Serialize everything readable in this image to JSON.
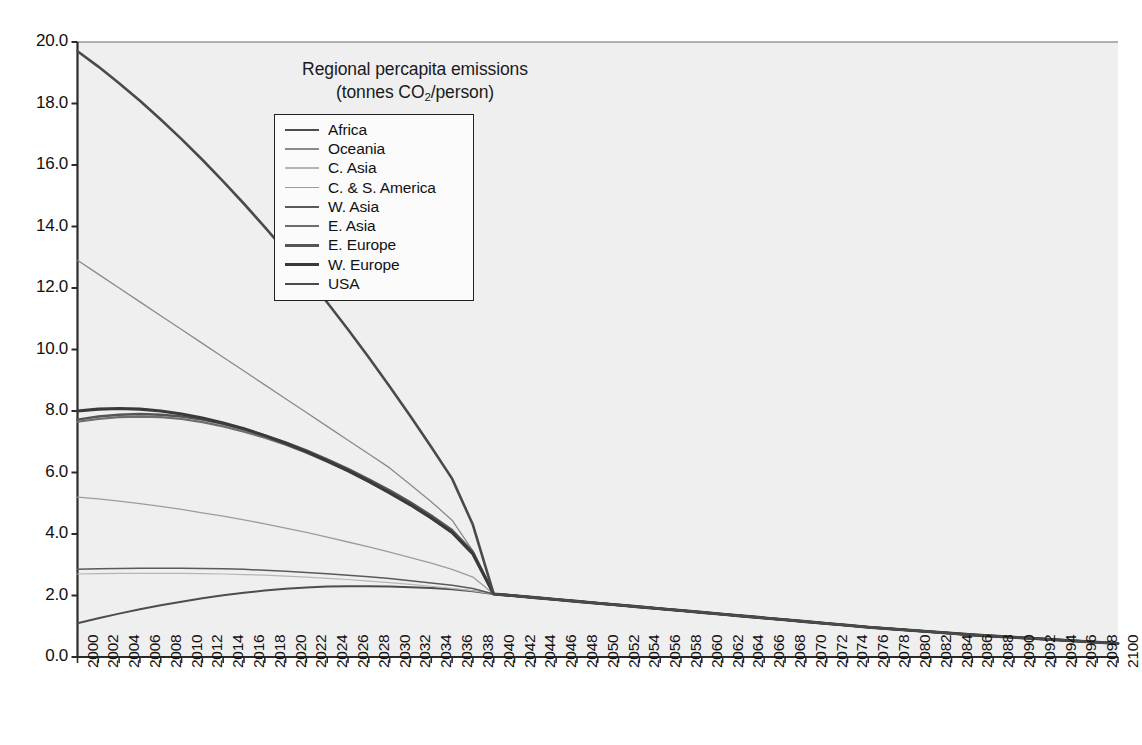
{
  "chart_data": {
    "type": "line",
    "title": "Regional percapita emissions",
    "subtitle": "(tonnes CO2/person)",
    "title_line1": "Regional percapita emissions",
    "title_line2_pre": "(tonnes CO",
    "title_line2_sub": "2",
    "title_line2_post": "/person)",
    "xlabel": "",
    "ylabel": "",
    "xlim": [
      2000,
      2100
    ],
    "ylim": [
      0.0,
      20.0
    ],
    "y_tick_step": 2.0,
    "x_tick_step": 2,
    "grid": false,
    "legend_position": "upper-center",
    "x": [
      2000,
      2002,
      2004,
      2006,
      2008,
      2010,
      2012,
      2014,
      2016,
      2018,
      2020,
      2022,
      2024,
      2026,
      2028,
      2030,
      2032,
      2034,
      2036,
      2038,
      2040,
      2042,
      2044,
      2046,
      2048,
      2050,
      2052,
      2054,
      2056,
      2058,
      2060,
      2062,
      2064,
      2066,
      2068,
      2070,
      2072,
      2074,
      2076,
      2078,
      2080,
      2082,
      2084,
      2086,
      2088,
      2090,
      2092,
      2094,
      2096,
      2098,
      2100
    ],
    "y_tick_labels": [
      "0.0",
      "2.0",
      "4.0",
      "6.0",
      "8.0",
      "10.0",
      "12.0",
      "14.0",
      "16.0",
      "18.0",
      "20.0"
    ],
    "x_tick_labels": [
      "2000",
      "2002",
      "2004",
      "2006",
      "2008",
      "2010",
      "2012",
      "2014",
      "2016",
      "2018",
      "2020",
      "2022",
      "2024",
      "2026",
      "2028",
      "2030",
      "2032",
      "2034",
      "2036",
      "2038",
      "2040",
      "2042",
      "2044",
      "2046",
      "2048",
      "2050",
      "2052",
      "2054",
      "2056",
      "2058",
      "2060",
      "2062",
      "2064",
      "2066",
      "2068",
      "2070",
      "2072",
      "2074",
      "2076",
      "2078",
      "2080",
      "2082",
      "2084",
      "2086",
      "2088",
      "2090",
      "2092",
      "2094",
      "2096",
      "2098",
      "2100"
    ],
    "series": [
      {
        "name": "Africa",
        "color": "#4d4d4d",
        "width": 2.0,
        "values": [
          1.1,
          1.26,
          1.41,
          1.55,
          1.68,
          1.8,
          1.91,
          2.01,
          2.09,
          2.16,
          2.22,
          2.26,
          2.29,
          2.3,
          2.3,
          2.29,
          2.27,
          2.24,
          2.2,
          2.14,
          2.05,
          1.99,
          1.93,
          1.87,
          1.81,
          1.75,
          1.69,
          1.63,
          1.57,
          1.51,
          1.45,
          1.39,
          1.33,
          1.27,
          1.21,
          1.15,
          1.09,
          1.03,
          0.97,
          0.92,
          0.87,
          0.82,
          0.77,
          0.72,
          0.68,
          0.64,
          0.6,
          0.56,
          0.52,
          0.48,
          0.44
        ]
      },
      {
        "name": "Oceania",
        "color": "#8a8a8a",
        "width": 1.3,
        "values": [
          12.9,
          12.45,
          12.0,
          11.55,
          11.1,
          10.65,
          10.2,
          9.75,
          9.3,
          8.85,
          8.4,
          7.95,
          7.5,
          7.05,
          6.6,
          6.15,
          5.6,
          5.05,
          4.45,
          3.45,
          2.05,
          1.99,
          1.93,
          1.87,
          1.81,
          1.75,
          1.69,
          1.63,
          1.57,
          1.51,
          1.45,
          1.39,
          1.33,
          1.27,
          1.21,
          1.15,
          1.09,
          1.03,
          0.97,
          0.92,
          0.87,
          0.82,
          0.77,
          0.72,
          0.68,
          0.64,
          0.6,
          0.56,
          0.52,
          0.48,
          0.44
        ]
      },
      {
        "name": "C. Asia",
        "color": "#b5b5b5",
        "width": 1.2,
        "values": [
          2.7,
          2.71,
          2.72,
          2.72,
          2.72,
          2.72,
          2.71,
          2.7,
          2.68,
          2.66,
          2.63,
          2.6,
          2.56,
          2.52,
          2.47,
          2.42,
          2.36,
          2.3,
          2.23,
          2.15,
          2.05,
          1.99,
          1.93,
          1.87,
          1.81,
          1.75,
          1.69,
          1.63,
          1.57,
          1.51,
          1.45,
          1.39,
          1.33,
          1.27,
          1.21,
          1.15,
          1.09,
          1.03,
          0.97,
          0.92,
          0.87,
          0.82,
          0.77,
          0.72,
          0.68,
          0.64,
          0.6,
          0.56,
          0.52,
          0.48,
          0.44
        ]
      },
      {
        "name": "C. & S. America",
        "color": "#9c9c9c",
        "width": 1.3,
        "values": [
          5.2,
          5.14,
          5.07,
          4.99,
          4.9,
          4.8,
          4.69,
          4.58,
          4.46,
          4.33,
          4.19,
          4.05,
          3.9,
          3.74,
          3.58,
          3.41,
          3.23,
          3.05,
          2.85,
          2.6,
          2.05,
          1.99,
          1.93,
          1.87,
          1.81,
          1.75,
          1.69,
          1.63,
          1.57,
          1.51,
          1.45,
          1.39,
          1.33,
          1.27,
          1.21,
          1.15,
          1.09,
          1.03,
          0.97,
          0.92,
          0.87,
          0.82,
          0.77,
          0.72,
          0.68,
          0.64,
          0.6,
          0.56,
          0.52,
          0.48,
          0.44
        ]
      },
      {
        "name": "W. Asia",
        "color": "#5a5a5a",
        "width": 1.5,
        "values": [
          2.85,
          2.87,
          2.88,
          2.89,
          2.89,
          2.89,
          2.88,
          2.87,
          2.85,
          2.82,
          2.79,
          2.75,
          2.71,
          2.66,
          2.61,
          2.55,
          2.48,
          2.41,
          2.33,
          2.23,
          2.05,
          1.99,
          1.93,
          1.87,
          1.81,
          1.75,
          1.69,
          1.63,
          1.57,
          1.51,
          1.45,
          1.39,
          1.33,
          1.27,
          1.21,
          1.15,
          1.09,
          1.03,
          0.97,
          0.92,
          0.87,
          0.82,
          0.77,
          0.72,
          0.68,
          0.64,
          0.6,
          0.56,
          0.52,
          0.48,
          0.44
        ]
      },
      {
        "name": "E. Asia",
        "color": "#6e6e6e",
        "width": 2.2,
        "values": [
          7.65,
          7.74,
          7.8,
          7.82,
          7.8,
          7.74,
          7.64,
          7.5,
          7.33,
          7.13,
          6.9,
          6.64,
          6.35,
          6.04,
          5.7,
          5.34,
          4.95,
          4.52,
          4.05,
          3.35,
          2.05,
          1.99,
          1.93,
          1.87,
          1.81,
          1.75,
          1.69,
          1.63,
          1.57,
          1.51,
          1.45,
          1.39,
          1.33,
          1.27,
          1.21,
          1.15,
          1.09,
          1.03,
          0.97,
          0.92,
          0.87,
          0.82,
          0.77,
          0.72,
          0.68,
          0.64,
          0.6,
          0.56,
          0.52,
          0.48,
          0.44
        ]
      },
      {
        "name": "E. Europe",
        "color": "#555555",
        "width": 2.4,
        "values": [
          7.72,
          7.82,
          7.88,
          7.9,
          7.88,
          7.82,
          7.72,
          7.58,
          7.41,
          7.21,
          6.98,
          6.72,
          6.43,
          6.12,
          5.78,
          5.42,
          5.03,
          4.6,
          4.13,
          3.42,
          2.05,
          1.99,
          1.93,
          1.87,
          1.81,
          1.75,
          1.69,
          1.63,
          1.57,
          1.51,
          1.45,
          1.39,
          1.33,
          1.27,
          1.21,
          1.15,
          1.09,
          1.03,
          0.97,
          0.92,
          0.87,
          0.82,
          0.77,
          0.72,
          0.68,
          0.64,
          0.6,
          0.56,
          0.52,
          0.48,
          0.44
        ]
      },
      {
        "name": "W. Europe",
        "color": "#3a3a3a",
        "width": 3.1,
        "values": [
          8.0,
          8.06,
          8.08,
          8.06,
          8.0,
          7.9,
          7.77,
          7.61,
          7.42,
          7.2,
          6.95,
          6.68,
          6.38,
          6.06,
          5.71,
          5.34,
          4.95,
          4.52,
          4.05,
          3.35,
          2.05,
          1.99,
          1.93,
          1.87,
          1.81,
          1.75,
          1.69,
          1.63,
          1.57,
          1.51,
          1.45,
          1.39,
          1.33,
          1.27,
          1.21,
          1.15,
          1.09,
          1.03,
          0.97,
          0.92,
          0.87,
          0.82,
          0.77,
          0.72,
          0.68,
          0.64,
          0.6,
          0.56,
          0.52,
          0.48,
          0.44
        ]
      },
      {
        "name": "USA",
        "color": "#4a4a4a",
        "width": 2.6,
        "values": [
          19.7,
          19.2,
          18.66,
          18.09,
          17.48,
          16.84,
          16.17,
          15.47,
          14.74,
          13.98,
          13.2,
          12.38,
          11.53,
          10.65,
          9.74,
          8.8,
          7.83,
          6.83,
          5.8,
          4.3,
          2.05,
          1.99,
          1.93,
          1.87,
          1.81,
          1.75,
          1.69,
          1.63,
          1.57,
          1.51,
          1.45,
          1.39,
          1.33,
          1.27,
          1.21,
          1.15,
          1.09,
          1.03,
          0.97,
          0.92,
          0.87,
          0.82,
          0.77,
          0.72,
          0.68,
          0.64,
          0.6,
          0.56,
          0.52,
          0.48,
          0.44
        ]
      }
    ]
  },
  "plot": {
    "bg_color": "#efefef",
    "axis_color": "#2a2a2a",
    "frame_top_color": "#9a9a9a"
  }
}
